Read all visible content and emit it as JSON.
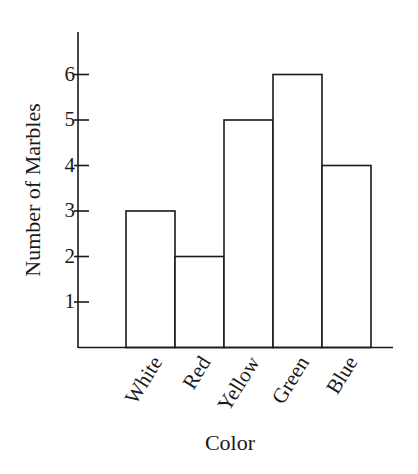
{
  "chart_data": {
    "type": "bar",
    "title": "",
    "xlabel": "Color",
    "ylabel": "Number of Marbles",
    "categories": [
      "White",
      "Red",
      "Yellow",
      "Green",
      "Blue"
    ],
    "values": [
      3,
      2,
      5,
      6,
      4
    ],
    "yticks": [
      1,
      2,
      3,
      4,
      5,
      6
    ],
    "ylim": [
      0,
      7
    ],
    "grid": false,
    "legend": null,
    "bar_fill": "#ffffff",
    "bar_stroke": "#1a1a1a"
  }
}
